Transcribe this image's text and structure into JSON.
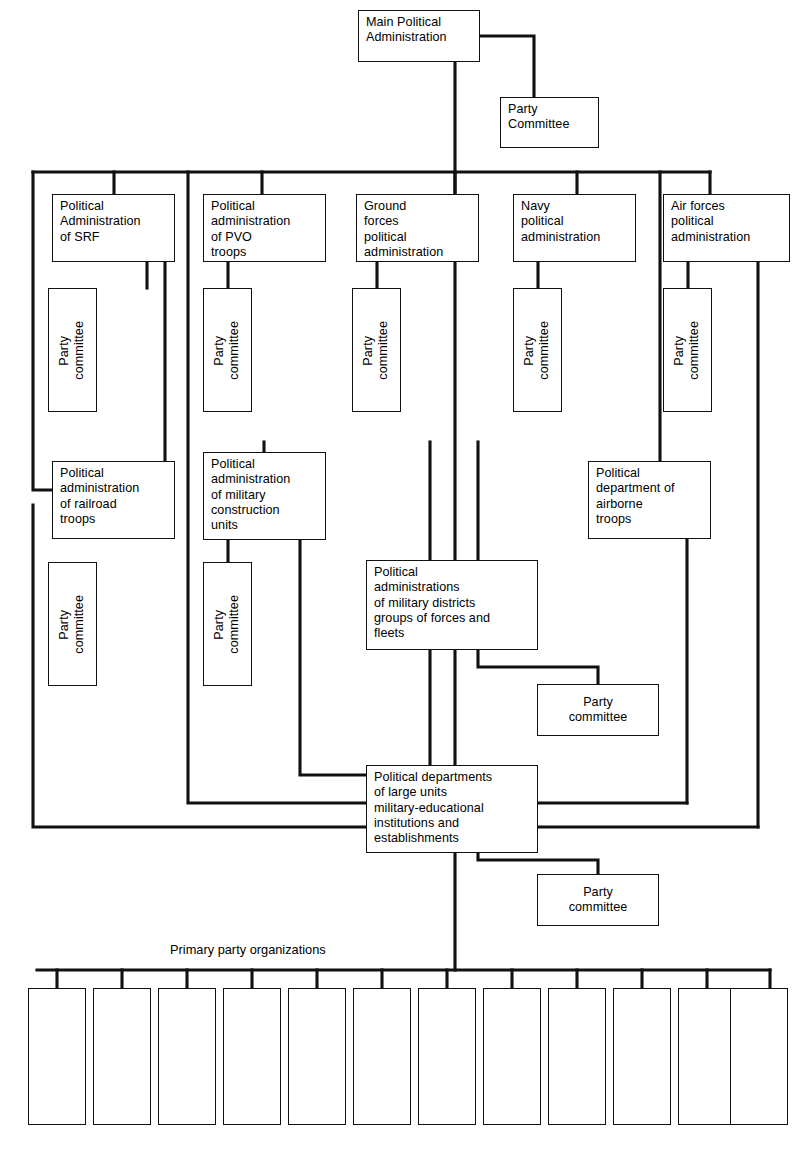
{
  "diagram": {
    "caption": {
      "primary_party_organizations": "Primary party organizations"
    },
    "colors": {
      "line": "#111111",
      "box_border": "#111111",
      "background": "#ffffff",
      "text": "#000000"
    },
    "nodes": [
      {
        "id": "main-political-administration",
        "label": "Main Political\nAdministration",
        "x": 358,
        "y": 10,
        "w": 122,
        "h": 52,
        "orient": "horizontal",
        "align": "left"
      },
      {
        "id": "party-committee-main",
        "label": "Party\nCommittee",
        "x": 500,
        "y": 97,
        "w": 99,
        "h": 51,
        "orient": "horizontal",
        "align": "left"
      },
      {
        "id": "political-administration-of-srf",
        "label": "Political\nAdministration\nof SRF",
        "x": 52,
        "y": 194,
        "w": 123,
        "h": 68,
        "orient": "horizontal",
        "align": "left"
      },
      {
        "id": "party-committee-srf",
        "label": "Party\ncommittee",
        "x": 48,
        "y": 288,
        "w": 49,
        "h": 124,
        "orient": "vertical",
        "align": "center"
      },
      {
        "id": "political-administration-of-pvo-troops",
        "label": "Political\nadministration\nof PVO\ntroops",
        "x": 203,
        "y": 194,
        "w": 123,
        "h": 68,
        "orient": "horizontal",
        "align": "left"
      },
      {
        "id": "party-committee-pvo",
        "label": "Party\ncommittee",
        "x": 203,
        "y": 288,
        "w": 49,
        "h": 124,
        "orient": "vertical",
        "align": "center"
      },
      {
        "id": "ground-forces-political-administration",
        "label": "Ground\nforces\npolitical\nadministration",
        "x": 356,
        "y": 194,
        "w": 123,
        "h": 68,
        "orient": "horizontal",
        "align": "left"
      },
      {
        "id": "party-committee-ground-forces",
        "label": "Party\ncommittee",
        "x": 352,
        "y": 288,
        "w": 49,
        "h": 124,
        "orient": "vertical",
        "align": "center"
      },
      {
        "id": "navy-political-administration",
        "label": "Navy\npolitical\nadministration",
        "x": 513,
        "y": 194,
        "w": 123,
        "h": 68,
        "orient": "horizontal",
        "align": "left"
      },
      {
        "id": "party-committee-navy",
        "label": "Party\ncommittee",
        "x": 513,
        "y": 288,
        "w": 49,
        "h": 124,
        "orient": "vertical",
        "align": "center"
      },
      {
        "id": "air-forces-political-administration",
        "label": "Air forces\npolitical\nadministration",
        "x": 663,
        "y": 194,
        "w": 127,
        "h": 68,
        "orient": "horizontal",
        "align": "left"
      },
      {
        "id": "party-committee-air-forces",
        "label": "Party\ncommittee",
        "x": 663,
        "y": 288,
        "w": 49,
        "h": 124,
        "orient": "vertical",
        "align": "center"
      },
      {
        "id": "political-administration-of-railroad-troops",
        "label": "Political\nadministration\nof railroad\ntroops",
        "x": 52,
        "y": 461,
        "w": 123,
        "h": 78,
        "orient": "horizontal",
        "align": "left"
      },
      {
        "id": "party-committee-railroad",
        "label": "Party\ncommittee",
        "x": 48,
        "y": 562,
        "w": 49,
        "h": 124,
        "orient": "vertical",
        "align": "center"
      },
      {
        "id": "political-administration-of-military-construction-units",
        "label": "Political\nadministration\nof military\nconstruction\nunits",
        "x": 203,
        "y": 452,
        "w": 123,
        "h": 88,
        "orient": "horizontal",
        "align": "left"
      },
      {
        "id": "party-committee-construction",
        "label": "Party\ncommittee",
        "x": 203,
        "y": 562,
        "w": 49,
        "h": 124,
        "orient": "vertical",
        "align": "center"
      },
      {
        "id": "political-department-of-airborne-troops",
        "label": "Political\ndepartment of\nairborne\ntroops",
        "x": 588,
        "y": 461,
        "w": 123,
        "h": 78,
        "orient": "horizontal",
        "align": "left"
      },
      {
        "id": "political-administrations-of-military-districts",
        "label": "Political\nadministrations\nof military districts\ngroups of forces and\nfleets",
        "x": 366,
        "y": 560,
        "w": 172,
        "h": 90,
        "orient": "horizontal",
        "align": "left"
      },
      {
        "id": "party-committee-districts",
        "label": "Party\ncommittee",
        "x": 537,
        "y": 684,
        "w": 122,
        "h": 52,
        "orient": "horizontal",
        "align": "center"
      },
      {
        "id": "political-departments-of-large-units",
        "label": "Political departments\nof large units\nmilitary-educational\ninstitutions and\nestablishments",
        "x": 366,
        "y": 765,
        "w": 172,
        "h": 88,
        "orient": "horizontal",
        "align": "left"
      },
      {
        "id": "party-committee-large-units",
        "label": "Party\ncommittee",
        "x": 537,
        "y": 874,
        "w": 122,
        "h": 52,
        "orient": "horizontal",
        "align": "center"
      }
    ],
    "primary_party_boxes": [
      {
        "id": "primary-party-organization-1",
        "x": 28,
        "y": 988,
        "w": 58,
        "h": 137
      },
      {
        "id": "primary-party-organization-2",
        "x": 93,
        "y": 988,
        "w": 58,
        "h": 137
      },
      {
        "id": "primary-party-organization-3",
        "x": 158,
        "y": 988,
        "w": 58,
        "h": 137
      },
      {
        "id": "primary-party-organization-4",
        "x": 223,
        "y": 988,
        "w": 58,
        "h": 137
      },
      {
        "id": "primary-party-organization-5",
        "x": 288,
        "y": 988,
        "w": 58,
        "h": 137
      },
      {
        "id": "primary-party-organization-6",
        "x": 353,
        "y": 988,
        "w": 58,
        "h": 137
      },
      {
        "id": "primary-party-organization-7",
        "x": 418,
        "y": 988,
        "w": 58,
        "h": 137
      },
      {
        "id": "primary-party-organization-8",
        "x": 483,
        "y": 988,
        "w": 58,
        "h": 137
      },
      {
        "id": "primary-party-organization-9",
        "x": 548,
        "y": 988,
        "w": 58,
        "h": 137
      },
      {
        "id": "primary-party-organization-10",
        "x": 613,
        "y": 988,
        "w": 58,
        "h": 137
      },
      {
        "id": "primary-party-organization-11",
        "x": 678,
        "y": 988,
        "w": 58,
        "h": 137
      },
      {
        "id": "primary-party-organization-12",
        "x": 730,
        "y": 988,
        "w": 58,
        "h": 137
      }
    ],
    "connectors": [
      "M419,36 H534 V97",
      "M455,62 V560",
      "M33,172 H710",
      "M33,172 V490 H52",
      "M114,172 V194",
      "M33,505 V827 H366",
      "M147,262 V288",
      "M165,262 V490",
      "M188,172 V803 H366",
      "M262,172 V194",
      "M228,262 V288",
      "M264,442 V452",
      "M228,540 V562",
      "M300,540 V775 H366",
      "M430,442 V560",
      "M455,172 V194",
      "M377,262 V288",
      "M478,442 V560",
      "M577,172 V194",
      "M538,262 V288",
      "M660,172 V461",
      "M687,539 V803",
      "M710,172 V194",
      "M688,262 V288",
      "M758,262 V827",
      "M538,803 H687",
      "M538,827 H758",
      "M430,650 V765",
      "M455,650 V765",
      "M455,853 V970",
      "M478,650 V667 H598 V684",
      "M478,853 V860 H598 V874",
      "M37,970 H770",
      "M57,970 V988",
      "M122,970 V988",
      "M187,970 V988",
      "M252,970 V988",
      "M317,970 V988",
      "M382,970 V988",
      "M447,970 V988",
      "M512,970 V988",
      "M577,970 V988",
      "M642,970 V988",
      "M707,970 V988",
      "M770,970 V988"
    ]
  }
}
